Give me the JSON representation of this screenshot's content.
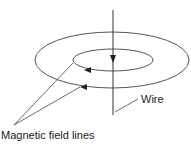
{
  "diagram": {
    "labels": {
      "wire": "Wire",
      "field_lines": "Magnetic field lines"
    },
    "colors": {
      "line": "#333333",
      "background": "#ffffff"
    }
  }
}
